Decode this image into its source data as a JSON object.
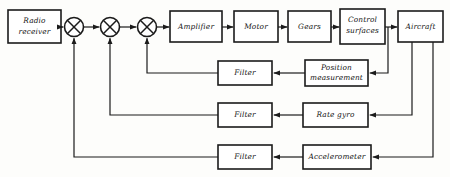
{
  "diagram": {
    "stroke_color": "#1b1b1b",
    "background_color": "#fdfdfb",
    "box_fill": "#ffffff",
    "forward_path": [
      {
        "id": "radio-receiver",
        "label": "Radio\nreceiver",
        "lines": [
          "Radio",
          "receiver"
        ],
        "x": 8,
        "y": 10,
        "w": 53,
        "h": 33
      },
      {
        "id": "amplifier",
        "label": "Amplifier",
        "lines": [
          "Amplifier"
        ],
        "x": 170,
        "y": 11,
        "w": 52,
        "h": 31
      },
      {
        "id": "motor",
        "label": "Motor",
        "lines": [
          "Motor"
        ],
        "x": 234,
        "y": 11,
        "w": 44,
        "h": 31
      },
      {
        "id": "gears",
        "label": "Gears",
        "lines": [
          "Gears"
        ],
        "x": 288,
        "y": 11,
        "w": 43,
        "h": 31
      },
      {
        "id": "control-surfaces",
        "label": "Control\nsurfaces",
        "lines": [
          "Control",
          "surfaces"
        ],
        "x": 340,
        "y": 9,
        "w": 45,
        "h": 35
      },
      {
        "id": "aircraft",
        "label": "Aircraft",
        "lines": [
          "Aircraft"
        ],
        "x": 398,
        "y": 11,
        "w": 45,
        "h": 31
      }
    ],
    "summing_junctions": [
      {
        "id": "summing-junction-1",
        "cx": 74,
        "cy": 27,
        "r": 9.5
      },
      {
        "id": "summing-junction-2",
        "cx": 110,
        "cy": 27,
        "r": 9.5
      },
      {
        "id": "summing-junction-3",
        "cx": 147,
        "cy": 27,
        "r": 9.5
      }
    ],
    "feedback_rows": [
      {
        "id": "position-loop",
        "filter": {
          "id": "filter-position",
          "label": "Filter",
          "lines": [
            "Filter"
          ],
          "x": 218,
          "y": 61,
          "w": 54,
          "h": 24
        },
        "sensor": {
          "id": "position-measurement",
          "label": "Position\nmeasurement",
          "lines": [
            "Position",
            "measurement"
          ],
          "x": 305,
          "y": 60,
          "w": 63,
          "h": 26
        },
        "tap_x": 388,
        "row_y": 73,
        "return_x": 147
      },
      {
        "id": "rate-loop",
        "filter": {
          "id": "filter-rate",
          "label": "Filter",
          "lines": [
            "Filter"
          ],
          "x": 218,
          "y": 103,
          "w": 54,
          "h": 24
        },
        "sensor": {
          "id": "rate-gyro",
          "label": "Rate gyro",
          "lines": [
            "Rate gyro"
          ],
          "x": 303,
          "y": 103,
          "w": 65,
          "h": 24
        },
        "tap_x": 412,
        "row_y": 115,
        "return_x": 110
      },
      {
        "id": "acceleration-loop",
        "filter": {
          "id": "filter-accel",
          "label": "Filter",
          "lines": [
            "Filter"
          ],
          "x": 218,
          "y": 145,
          "w": 54,
          "h": 24
        },
        "sensor": {
          "id": "accelerometer",
          "label": "Accelerometer",
          "lines": [
            "Accelerometer"
          ],
          "x": 303,
          "y": 145,
          "w": 68,
          "h": 24
        },
        "tap_x": 433,
        "row_y": 157,
        "return_x": 74
      }
    ],
    "signal_flow_notes": {
      "input_source": "Radio receiver",
      "plant": "Aircraft",
      "loop_count": 3
    }
  }
}
